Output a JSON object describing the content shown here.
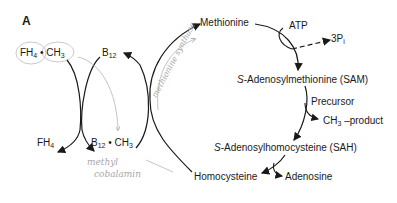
{
  "panel_label": "A",
  "nodes": {
    "fh4_ch3": {
      "a": "FH",
      "a_sub": "4",
      "dot": " • CH",
      "b_sub": "3"
    },
    "b12": {
      "a": "B",
      "a_sub": "12"
    },
    "fh4": {
      "a": "FH",
      "a_sub": "4"
    },
    "b12_ch3": {
      "a": "B",
      "a_sub": "12",
      "dot": " • CH",
      "b_sub": "3"
    },
    "methionine": "Methionine",
    "atp": "ATP",
    "pi": {
      "a": "3P",
      "a_sub": "i"
    },
    "sam": {
      "italic": "S",
      "rest": "-Adenosylmethionine (SAM)"
    },
    "precursor": "Precursor",
    "ch3_product": {
      "a": "CH",
      "a_sub": "3",
      "rest": " –product"
    },
    "sah": {
      "italic": "S",
      "rest": "-Adenosylhomocysteine (SAH)"
    },
    "homocysteine": "Homocysteine",
    "adenosine": "Adenosine"
  },
  "annotations": {
    "enzyme": "methionine synthase",
    "cofactor_line1": "methyl",
    "cofactor_line2": "cobalamin"
  },
  "colors": {
    "ink": "#1a1a1a",
    "pencil": "#a8a8a8"
  }
}
